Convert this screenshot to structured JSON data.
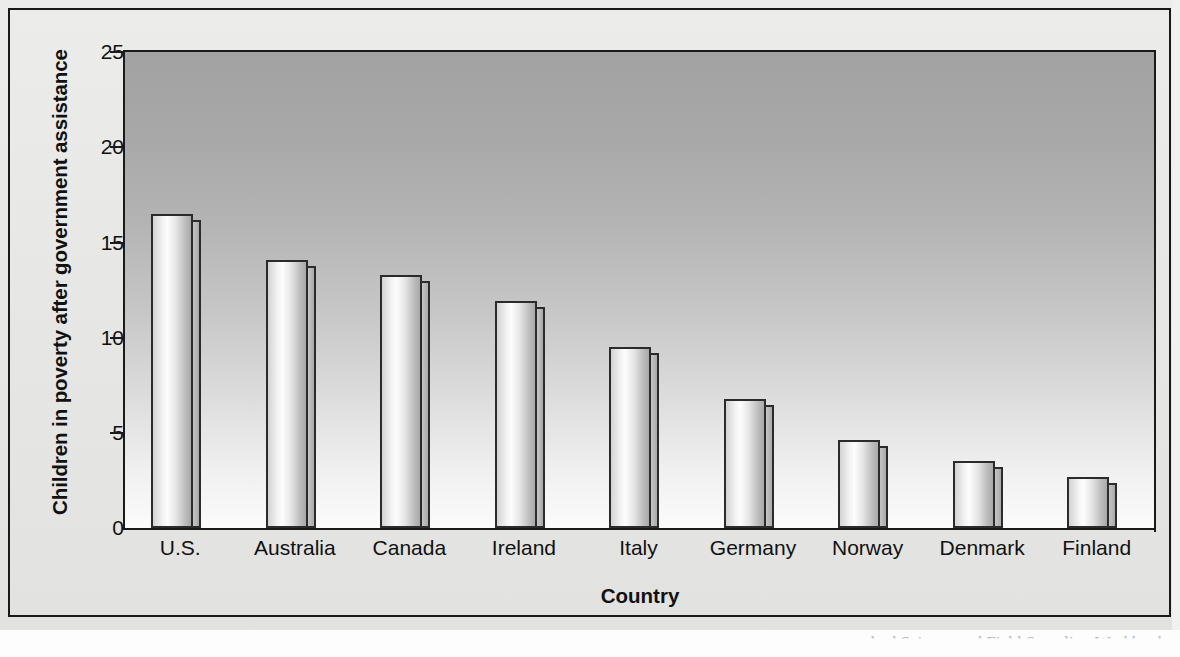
{
  "chart_data": {
    "type": "bar",
    "title": "",
    "xlabel": "Country",
    "ylabel": "Children in poverty after government assistance",
    "categories": [
      "U.S.",
      "Australia",
      "Canada",
      "Ireland",
      "Italy",
      "Germany",
      "Norway",
      "Denmark",
      "Finland"
    ],
    "values": [
      16.5,
      14.1,
      13.3,
      11.9,
      9.5,
      6.8,
      4.6,
      3.5,
      2.7
    ],
    "ylim": [
      0,
      25
    ],
    "yticks": [
      0,
      5,
      10,
      15,
      20,
      25
    ],
    "ytick_labels": [
      "0",
      "5",
      "10",
      "15",
      "20",
      "25"
    ],
    "grid": false,
    "legend": "none",
    "style": {
      "bar_style": "3d-cylinder",
      "plot_background": "vertical-gradient-gray-to-white",
      "page_background": "#e9e9e7",
      "bar_outline": "#2b2b2b",
      "axis_color": "#1a1a1a",
      "text_color": "#111111"
    }
  },
  "caption": {
    "partial_text": "hod Science and Field Sampling Workbook"
  }
}
